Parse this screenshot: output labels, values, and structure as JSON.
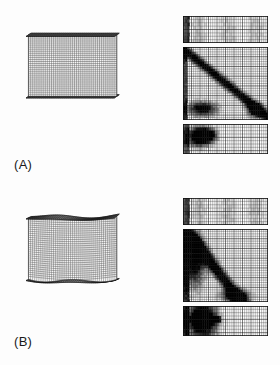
{
  "figure": {
    "background_color": "#fdfdfd",
    "ink_color": "#111111",
    "width": 280,
    "height": 365,
    "kind": "finite-element-mesh-contour-figure"
  },
  "subfigures": [
    {
      "id": "A",
      "label": "(A)",
      "beam": {
        "name": "plate-girder-mesh-a",
        "view": "isometric",
        "state": "undeformed",
        "flange_state": "flat",
        "web_mesh_cols": 46,
        "web_mesh_rows": 30,
        "flange_mesh_cols": 46,
        "flange_mesh_rows": 7
      },
      "panels": [
        {
          "id": "a-top-flange",
          "name": "top-flange-contour",
          "mesh_cols": 40,
          "mesh_rows": 8,
          "pattern": "uniform-light",
          "darkness": 0.18
        },
        {
          "id": "a-web",
          "name": "web-contour",
          "mesh_cols": 40,
          "mesh_rows": 30,
          "pattern": "diagonal-tension-band",
          "darkness": 0.55
        },
        {
          "id": "a-bottom-flange",
          "name": "bottom-flange-contour",
          "mesh_cols": 40,
          "mesh_rows": 9,
          "pattern": "left-blob",
          "darkness": 0.45
        }
      ]
    },
    {
      "id": "B",
      "label": "(B)",
      "beam": {
        "name": "plate-girder-mesh-b",
        "view": "isometric",
        "state": "deformed",
        "flange_state": "buckled",
        "web_mesh_cols": 46,
        "web_mesh_rows": 30,
        "flange_mesh_cols": 46,
        "flange_mesh_rows": 7
      },
      "panels": [
        {
          "id": "b-top-flange",
          "name": "top-flange-contour",
          "mesh_cols": 40,
          "mesh_rows": 8,
          "pattern": "uniform-light",
          "darkness": 0.2
        },
        {
          "id": "b-web",
          "name": "web-contour",
          "mesh_cols": 40,
          "mesh_rows": 30,
          "pattern": "left-concentrated-band",
          "darkness": 0.6
        },
        {
          "id": "b-bottom-flange",
          "name": "bottom-flange-contour",
          "mesh_cols": 40,
          "mesh_rows": 9,
          "pattern": "left-dark-bar",
          "darkness": 0.5
        }
      ]
    }
  ]
}
